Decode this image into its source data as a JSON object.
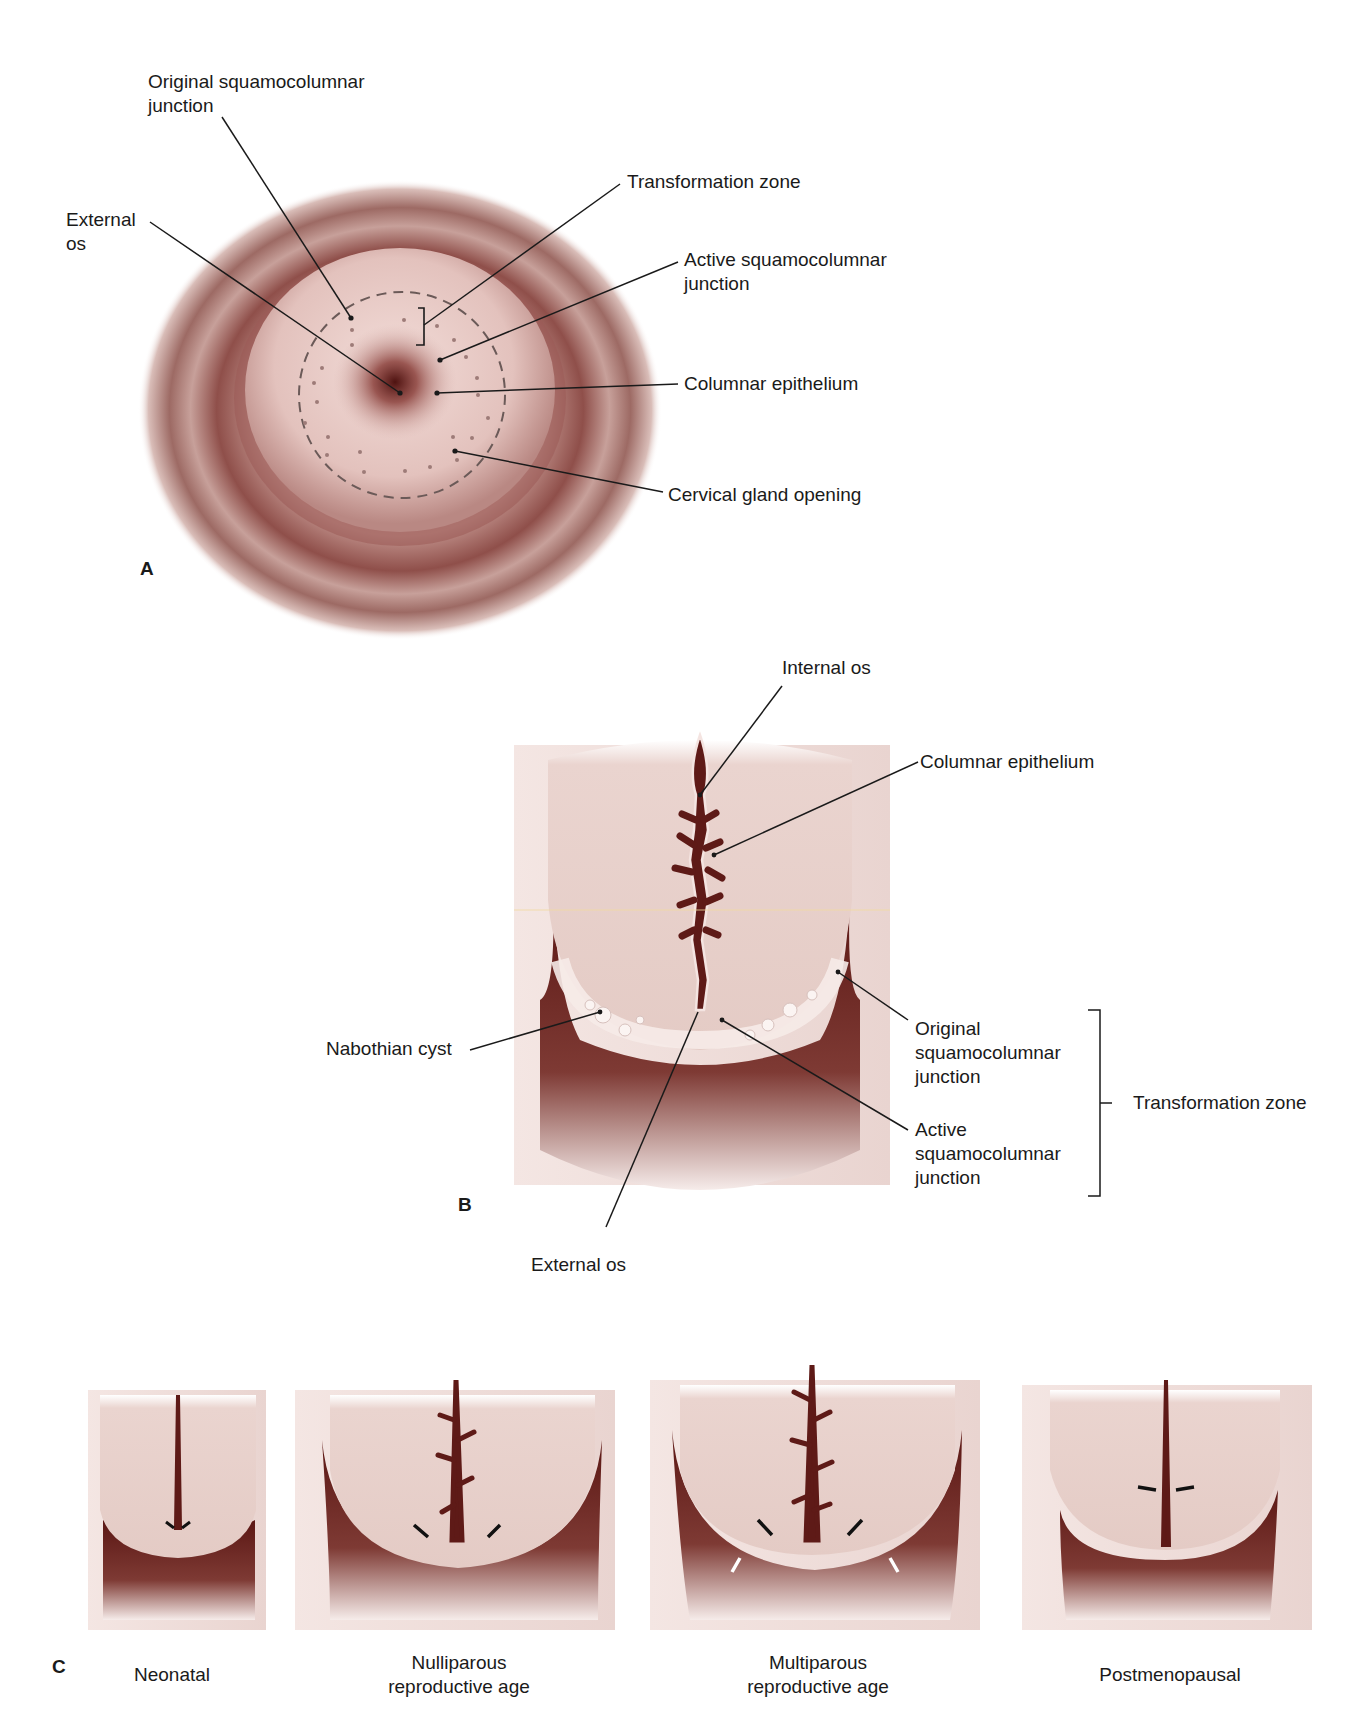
{
  "figure": {
    "colors": {
      "tissue_light": "#ecd3cf",
      "tissue_mid": "#c89a94",
      "tissue_dark": "#7a2e2a",
      "canal": "#5e1a17",
      "leader": "#1a1a1a",
      "dashed_line": "#6b5a58"
    }
  },
  "panel_a": {
    "letter": "A",
    "labels": {
      "original_scj": "Original squamocolumnar\njunction",
      "external_os": "External\nos",
      "transformation_zone": "Transformation zone",
      "active_scj": "Active squamocolumnar\njunction",
      "columnar_epithelium": "Columnar epithelium",
      "cervical_gland_opening": "Cervical gland opening"
    }
  },
  "panel_b": {
    "letter": "B",
    "labels": {
      "internal_os": "Internal os",
      "columnar_epithelium": "Columnar epithelium",
      "nabothian_cyst": "Nabothian cyst",
      "original_scj": "Original\nsquamocolumnar\njunction",
      "active_scj": "Active\nsquamocolumnar\njunction",
      "transformation_zone": "Transformation zone",
      "external_os": "External os"
    }
  },
  "panel_c": {
    "letter": "C",
    "stages": [
      {
        "label": "Neonatal"
      },
      {
        "label": "Nulliparous\nreproductive age"
      },
      {
        "label": "Multiparous\nreproductive age"
      },
      {
        "label": "Postmenopausal"
      }
    ]
  }
}
